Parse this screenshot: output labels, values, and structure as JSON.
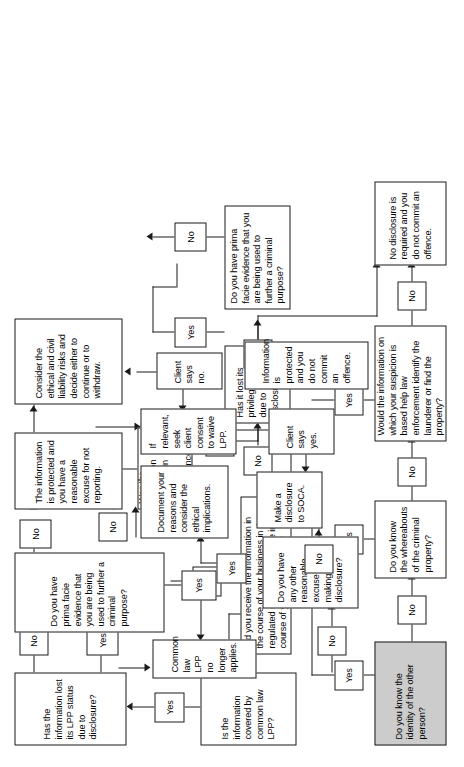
{
  "diagram": {
    "orientation": "rotated-90-ccw",
    "colors": {
      "stroke": "#1a1a1a",
      "background": "#ffffff",
      "shaded_node_fill": "#cccccc"
    },
    "nodes": {
      "start_identity": "Do you know the identity of the other person?",
      "whereabouts": "Do you know the whereabouts of the criminal property?",
      "would_info_help": "Would the information on which your suspicion is based help law enforcement identify the launderer or find the property?",
      "no_disclosure_required": "No disclosure is required and you do not commit an offence.",
      "did_you_receive": "Did you receive the information in the course of your business in the regulated sector or otherwise in the course of your employment?",
      "privileged_circumstances": "Was the information obtained in privileged circumstances?",
      "has_it_lost_privileged": "Has it lost its privileged status due to disclosure?",
      "prima_facie_lower": "Do you have prima facie evidence that you are being used to further a criminal purpose?",
      "covered_by_lpp": "Is the information covered by common law LPP?",
      "any_other_excuse": "Do you have any other reasonable excuse for not making a disclosure?",
      "has_lost_lpp_status": "Has the information lost its LPP status due to disclosure?",
      "common_law_no_longer": "Common law LPP no longer applies.",
      "prima_facie_upper": "Do you have prima facie evidence that you are being used to further a criminal purpose?",
      "information_protected_excuse": "The information is protected and you have a reasonable excuse for not reporting.",
      "consider_ethical": "Consider the ethical and civil liability risks and decide either to continue or to withdraw.",
      "document_reasons": "Document your reasons and consider the ethical implications.",
      "seek_client_consent": "If relevant, seek client consent to waive LPP.",
      "client_says_yes": "Client says yes.",
      "client_says_no": "Client says no.",
      "make_disclosure_soca": "Make a disclosure to SOCA.",
      "information_protected_no_offence": "Information is protected and you do not commit an offence."
    },
    "edge_labels": {
      "identity_yes": "Yes",
      "identity_no": "No",
      "whereabouts_yes": "Yes",
      "whereabouts_no": "No",
      "would_help_yes": "Yes",
      "would_help_no": "No",
      "receive_yes": "Yes",
      "receive_no": "No",
      "privileged_yes": "Yes",
      "privileged_no": "No",
      "lost_privileged_yes": "Yes",
      "lost_privileged_no": "No",
      "prima_facie_lower_no": "No",
      "covered_lpp_yes": "Yes",
      "covered_lpp_no": "No",
      "lost_lpp_yes": "Yes",
      "lost_lpp_no": "No",
      "prima_facie_upper_yes": "Yes",
      "prima_facie_upper_no": "No",
      "other_excuse_yes": "Yes",
      "other_excuse_no": "No"
    }
  }
}
